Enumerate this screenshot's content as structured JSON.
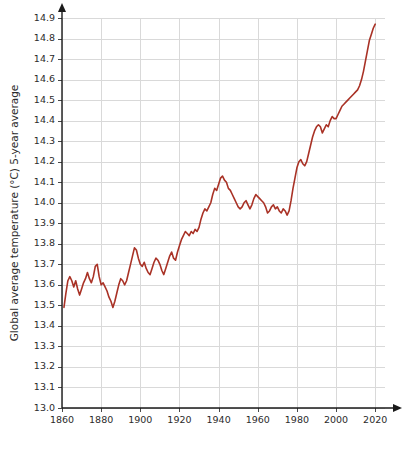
{
  "chart_data": {
    "type": "line",
    "title": "",
    "xlabel": "",
    "ylabel": "Global average temperature (°C) 5-year average",
    "xlim": [
      1860,
      2025
    ],
    "ylim": [
      13.0,
      14.9
    ],
    "grid": true,
    "legend": null,
    "series_color": "#a93226",
    "x_ticks": [
      1860,
      1880,
      1900,
      1920,
      1940,
      1960,
      1980,
      2000,
      2020
    ],
    "y_ticks": [
      13.0,
      13.1,
      13.2,
      13.3,
      13.4,
      13.5,
      13.6,
      13.7,
      13.8,
      13.9,
      14.0,
      14.1,
      14.2,
      14.3,
      14.4,
      14.5,
      14.6,
      14.7,
      14.8,
      14.9
    ],
    "y_tick_labels": [
      "13.0",
      "13.1",
      "13.2",
      "13.3",
      "13.4",
      "13.5",
      "13.6",
      "13.7",
      "13.8",
      "13.9",
      "14.0",
      "14.1",
      "14.2",
      "14.3",
      "14.4",
      "14.5",
      "14.6",
      "14.7",
      "14.8",
      "14.9"
    ],
    "x_tick_labels": [
      "1860",
      "1880",
      "1900",
      "1920",
      "1940",
      "1960",
      "1980",
      "2000",
      "2020"
    ],
    "series": [
      {
        "name": "Global average temperature (5-year average)",
        "color": "#a93226",
        "x": [
          1861,
          1862,
          1863,
          1864,
          1865,
          1866,
          1867,
          1868,
          1869,
          1870,
          1871,
          1872,
          1873,
          1874,
          1875,
          1876,
          1877,
          1878,
          1879,
          1880,
          1881,
          1882,
          1883,
          1884,
          1885,
          1886,
          1887,
          1888,
          1889,
          1890,
          1891,
          1892,
          1893,
          1894,
          1895,
          1896,
          1897,
          1898,
          1899,
          1900,
          1901,
          1902,
          1903,
          1904,
          1905,
          1906,
          1907,
          1908,
          1909,
          1910,
          1911,
          1912,
          1913,
          1914,
          1915,
          1916,
          1917,
          1918,
          1919,
          1920,
          1921,
          1922,
          1923,
          1924,
          1925,
          1926,
          1927,
          1928,
          1929,
          1930,
          1931,
          1932,
          1933,
          1934,
          1935,
          1936,
          1937,
          1938,
          1939,
          1940,
          1941,
          1942,
          1943,
          1944,
          1945,
          1946,
          1947,
          1948,
          1949,
          1950,
          1951,
          1952,
          1953,
          1954,
          1955,
          1956,
          1957,
          1958,
          1959,
          1960,
          1961,
          1962,
          1963,
          1964,
          1965,
          1966,
          1967,
          1968,
          1969,
          1970,
          1971,
          1972,
          1973,
          1974,
          1975,
          1976,
          1977,
          1978,
          1979,
          1980,
          1981,
          1982,
          1983,
          1984,
          1985,
          1986,
          1987,
          1988,
          1989,
          1990,
          1991,
          1992,
          1993,
          1994,
          1995,
          1996,
          1997,
          1998,
          1999,
          2000,
          2001,
          2002,
          2003,
          2004,
          2005,
          2006,
          2007,
          2008,
          2009,
          2010,
          2011,
          2012,
          2013,
          2014,
          2015,
          2016,
          2017,
          2018,
          2019,
          2020
        ],
        "values": [
          13.49,
          13.56,
          13.62,
          13.64,
          13.62,
          13.59,
          13.62,
          13.58,
          13.55,
          13.58,
          13.61,
          13.63,
          13.66,
          13.63,
          13.61,
          13.64,
          13.69,
          13.7,
          13.64,
          13.6,
          13.61,
          13.59,
          13.57,
          13.54,
          13.52,
          13.49,
          13.52,
          13.56,
          13.6,
          13.63,
          13.62,
          13.6,
          13.62,
          13.66,
          13.7,
          13.74,
          13.78,
          13.77,
          13.73,
          13.7,
          13.69,
          13.71,
          13.68,
          13.66,
          13.65,
          13.68,
          13.71,
          13.73,
          13.72,
          13.7,
          13.67,
          13.65,
          13.68,
          13.71,
          13.74,
          13.76,
          13.73,
          13.72,
          13.76,
          13.79,
          13.82,
          13.84,
          13.86,
          13.85,
          13.84,
          13.86,
          13.85,
          13.87,
          13.86,
          13.88,
          13.92,
          13.95,
          13.97,
          13.96,
          13.98,
          14.0,
          14.04,
          14.07,
          14.06,
          14.09,
          14.12,
          14.13,
          14.11,
          14.1,
          14.07,
          14.06,
          14.04,
          14.02,
          14.0,
          13.98,
          13.97,
          13.98,
          14.0,
          14.01,
          13.99,
          13.97,
          13.99,
          14.02,
          14.04,
          14.03,
          14.02,
          14.01,
          14.0,
          13.98,
          13.95,
          13.96,
          13.98,
          13.99,
          13.97,
          13.98,
          13.96,
          13.95,
          13.97,
          13.96,
          13.94,
          13.96,
          14.01,
          14.07,
          14.12,
          14.17,
          14.2,
          14.21,
          14.19,
          14.18,
          14.2,
          14.24,
          14.28,
          14.32,
          14.35,
          14.37,
          14.38,
          14.37,
          14.34,
          14.36,
          14.38,
          14.37,
          14.4,
          14.42,
          14.41,
          14.41,
          14.43,
          14.45,
          14.47,
          14.48,
          14.49,
          14.5,
          14.51,
          14.52,
          14.53,
          14.54,
          14.55,
          14.57,
          14.6,
          14.64,
          14.69,
          14.74,
          14.79,
          14.82,
          14.85,
          14.87
        ]
      }
    ]
  }
}
